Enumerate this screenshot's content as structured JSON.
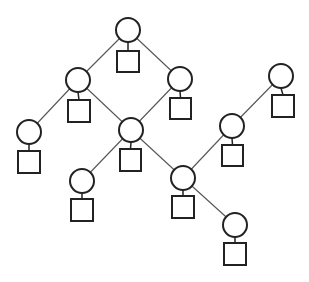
{
  "diagram": {
    "type": "tree-network",
    "colors": {
      "stroke": "#222222",
      "edge": "#555555",
      "background": "#ffffff"
    },
    "nodes": [
      {
        "id": "A",
        "cx": 128,
        "cy": 30,
        "r": 12,
        "square": {
          "x": 117,
          "y": 51,
          "w": 22,
          "h": 21
        }
      },
      {
        "id": "B",
        "cx": 78,
        "cy": 80,
        "r": 12,
        "square": {
          "x": 68,
          "y": 100,
          "w": 22,
          "h": 22
        }
      },
      {
        "id": "C",
        "cx": 180,
        "cy": 79,
        "r": 12,
        "square": {
          "x": 170,
          "y": 98,
          "w": 21,
          "h": 21
        }
      },
      {
        "id": "D",
        "cx": 281,
        "cy": 76,
        "r": 12,
        "square": {
          "x": 272,
          "y": 95,
          "w": 22,
          "h": 22
        }
      },
      {
        "id": "E",
        "cx": 29,
        "cy": 132,
        "r": 12,
        "square": {
          "x": 18,
          "y": 151,
          "w": 22,
          "h": 22
        }
      },
      {
        "id": "F",
        "cx": 131,
        "cy": 130,
        "r": 12,
        "square": {
          "x": 120,
          "y": 149,
          "w": 21,
          "h": 22
        }
      },
      {
        "id": "G",
        "cx": 232,
        "cy": 126,
        "r": 12,
        "square": {
          "x": 222,
          "y": 145,
          "w": 21,
          "h": 21
        }
      },
      {
        "id": "H",
        "cx": 82,
        "cy": 181,
        "r": 12,
        "square": {
          "x": 71,
          "y": 199,
          "w": 22,
          "h": 22
        }
      },
      {
        "id": "I",
        "cx": 183,
        "cy": 178,
        "r": 12,
        "square": {
          "x": 172,
          "y": 196,
          "w": 22,
          "h": 22
        }
      },
      {
        "id": "J",
        "cx": 235,
        "cy": 225,
        "r": 12,
        "square": {
          "x": 224,
          "y": 243,
          "w": 22,
          "h": 22
        }
      }
    ],
    "edges": [
      [
        "A",
        "B"
      ],
      [
        "A",
        "C"
      ],
      [
        "B",
        "E"
      ],
      [
        "B",
        "F"
      ],
      [
        "C",
        "F"
      ],
      [
        "F",
        "H"
      ],
      [
        "F",
        "I"
      ],
      [
        "I",
        "G"
      ],
      [
        "G",
        "D"
      ],
      [
        "I",
        "J"
      ]
    ]
  }
}
